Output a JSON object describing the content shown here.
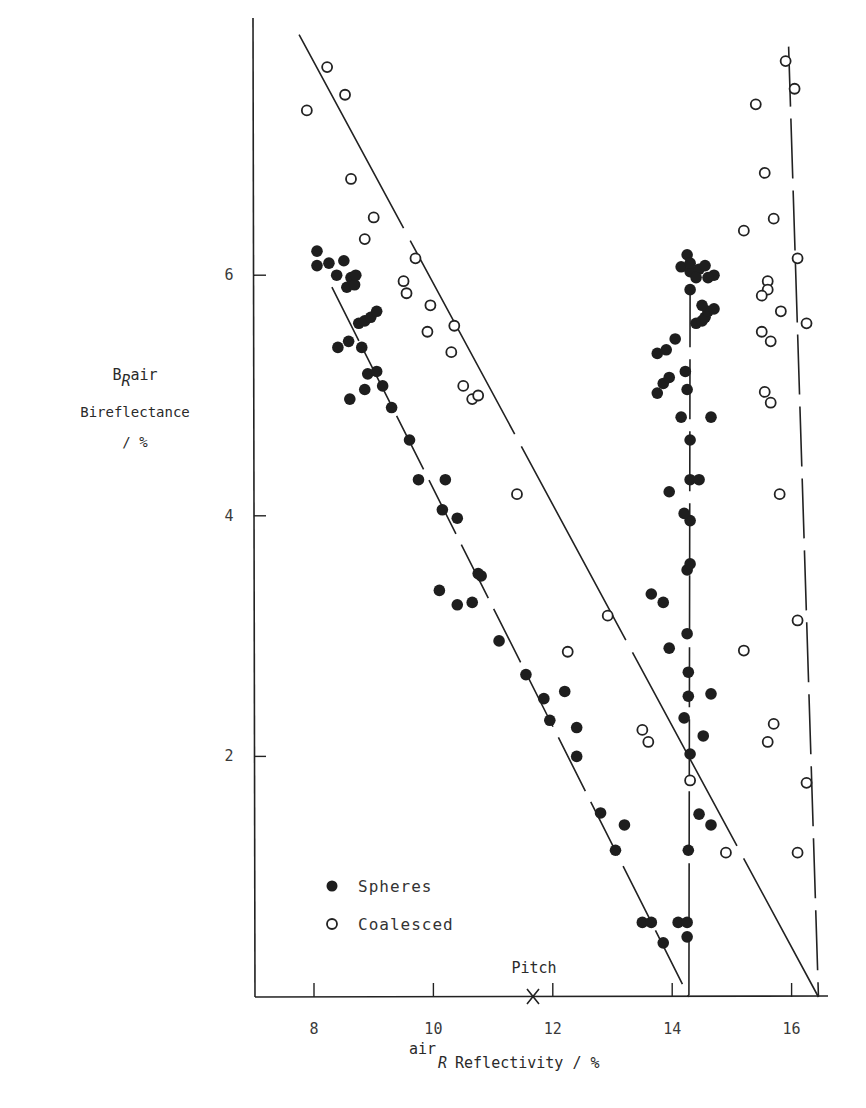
{
  "chart_data": {
    "type": "scatter",
    "title": "",
    "xlabel": "airR Reflectivity / %",
    "ylabel": "B R air Bireflectance / %",
    "xlim": [
      7.0,
      16.6
    ],
    "ylim": [
      0,
      8.2
    ],
    "x_ticks": [
      8,
      10,
      12,
      14,
      16
    ],
    "y_ticks": [
      2,
      4,
      6
    ],
    "grid": false,
    "legend_position": "lower-left",
    "annotations": [
      {
        "text": "Pitch",
        "x": 11.8,
        "y": 0,
        "marker": "X"
      }
    ],
    "series": [
      {
        "name": "Spheres",
        "marker": "filled-circle",
        "points": [
          [
            8.05,
            6.2
          ],
          [
            8.05,
            6.08
          ],
          [
            8.25,
            6.1
          ],
          [
            8.38,
            6.0
          ],
          [
            8.5,
            6.12
          ],
          [
            8.62,
            5.98
          ],
          [
            8.55,
            5.9
          ],
          [
            8.68,
            5.92
          ],
          [
            8.7,
            6.0
          ],
          [
            8.4,
            5.4
          ],
          [
            8.58,
            5.45
          ],
          [
            8.75,
            5.6
          ],
          [
            8.85,
            5.62
          ],
          [
            8.95,
            5.65
          ],
          [
            9.05,
            5.7
          ],
          [
            8.8,
            5.4
          ],
          [
            8.9,
            5.18
          ],
          [
            8.85,
            5.05
          ],
          [
            9.05,
            5.2
          ],
          [
            8.6,
            4.97
          ],
          [
            9.15,
            5.08
          ],
          [
            9.3,
            4.9
          ],
          [
            9.6,
            4.63
          ],
          [
            9.75,
            4.3
          ],
          [
            10.2,
            4.3
          ],
          [
            10.15,
            4.05
          ],
          [
            10.4,
            3.98
          ],
          [
            10.75,
            3.52
          ],
          [
            10.8,
            3.5
          ],
          [
            10.1,
            3.38
          ],
          [
            10.4,
            3.26
          ],
          [
            10.65,
            3.28
          ],
          [
            11.1,
            2.96
          ],
          [
            11.55,
            2.68
          ],
          [
            11.85,
            2.48
          ],
          [
            11.95,
            2.3
          ],
          [
            12.2,
            2.54
          ],
          [
            12.4,
            2.24
          ],
          [
            12.4,
            2.0
          ],
          [
            12.8,
            1.53
          ],
          [
            13.05,
            1.22
          ],
          [
            13.2,
            1.43
          ],
          [
            13.5,
            0.62
          ],
          [
            13.65,
            0.62
          ],
          [
            13.85,
            0.45
          ],
          [
            14.1,
            0.62
          ],
          [
            14.25,
            0.62
          ],
          [
            14.25,
            0.5
          ],
          [
            14.27,
            1.22
          ],
          [
            14.45,
            1.52
          ],
          [
            14.65,
            1.43
          ],
          [
            14.52,
            2.17
          ],
          [
            14.65,
            2.52
          ],
          [
            14.3,
            2.02
          ],
          [
            14.2,
            2.32
          ],
          [
            14.27,
            2.5
          ],
          [
            14.27,
            2.7
          ],
          [
            14.25,
            3.02
          ],
          [
            14.25,
            3.55
          ],
          [
            14.3,
            3.6
          ],
          [
            14.3,
            3.96
          ],
          [
            14.2,
            4.02
          ],
          [
            13.95,
            4.2
          ],
          [
            14.3,
            4.3
          ],
          [
            14.45,
            4.3
          ],
          [
            14.3,
            4.63
          ],
          [
            14.15,
            4.82
          ],
          [
            14.65,
            4.82
          ],
          [
            14.25,
            5.05
          ],
          [
            14.22,
            5.2
          ],
          [
            13.75,
            5.02
          ],
          [
            13.85,
            5.1
          ],
          [
            13.95,
            5.15
          ],
          [
            13.75,
            5.35
          ],
          [
            13.9,
            5.38
          ],
          [
            14.05,
            5.47
          ],
          [
            14.4,
            5.6
          ],
          [
            14.5,
            5.62
          ],
          [
            14.55,
            5.65
          ],
          [
            14.6,
            5.7
          ],
          [
            14.7,
            5.72
          ],
          [
            14.5,
            5.75
          ],
          [
            14.3,
            5.88
          ],
          [
            14.15,
            6.07
          ],
          [
            14.3,
            6.03
          ],
          [
            14.45,
            6.05
          ],
          [
            14.55,
            6.08
          ],
          [
            14.7,
            6.0
          ],
          [
            14.6,
            5.98
          ],
          [
            14.25,
            6.17
          ],
          [
            14.3,
            6.1
          ],
          [
            14.4,
            5.98
          ],
          [
            13.95,
            2.9
          ],
          [
            13.65,
            3.35
          ],
          [
            13.85,
            3.28
          ]
        ]
      },
      {
        "name": "Coalesced",
        "marker": "open-circle",
        "points": [
          [
            7.88,
            7.37
          ],
          [
            8.22,
            7.73
          ],
          [
            8.52,
            7.5
          ],
          [
            8.62,
            6.8
          ],
          [
            8.85,
            6.3
          ],
          [
            9.0,
            6.48
          ],
          [
            9.7,
            6.14
          ],
          [
            9.5,
            5.95
          ],
          [
            9.55,
            5.85
          ],
          [
            9.95,
            5.75
          ],
          [
            9.9,
            5.53
          ],
          [
            10.35,
            5.58
          ],
          [
            10.3,
            5.36
          ],
          [
            10.5,
            5.08
          ],
          [
            10.65,
            4.97
          ],
          [
            10.75,
            5.0
          ],
          [
            11.4,
            4.18
          ],
          [
            12.92,
            3.17
          ],
          [
            12.25,
            2.87
          ],
          [
            13.5,
            2.22
          ],
          [
            13.6,
            2.12
          ],
          [
            14.3,
            1.8
          ],
          [
            14.9,
            1.2
          ],
          [
            15.9,
            7.78
          ],
          [
            16.05,
            7.55
          ],
          [
            15.4,
            7.42
          ],
          [
            15.55,
            6.85
          ],
          [
            15.7,
            6.47
          ],
          [
            15.2,
            6.37
          ],
          [
            16.1,
            6.14
          ],
          [
            15.6,
            5.95
          ],
          [
            15.6,
            5.88
          ],
          [
            15.5,
            5.83
          ],
          [
            15.82,
            5.7
          ],
          [
            16.25,
            5.6
          ],
          [
            15.5,
            5.53
          ],
          [
            15.65,
            5.45
          ],
          [
            15.55,
            5.03
          ],
          [
            15.65,
            4.94
          ],
          [
            15.8,
            4.18
          ],
          [
            16.1,
            3.13
          ],
          [
            15.2,
            2.88
          ],
          [
            15.7,
            2.27
          ],
          [
            15.6,
            2.12
          ],
          [
            16.25,
            1.78
          ],
          [
            16.1,
            1.2
          ]
        ]
      }
    ],
    "fit_lines": [
      {
        "series": "Coalesced",
        "style": "long-dash",
        "from": [
          7.75,
          8.0
        ],
        "to": [
          16.45,
          0
        ]
      },
      {
        "series": "Spheres",
        "style": "dash",
        "from": [
          8.3,
          5.9
        ],
        "to": [
          14.28,
          0
        ]
      },
      {
        "series": "Spheres",
        "style": "dash",
        "from": [
          14.3,
          5.9
        ],
        "to": [
          14.28,
          0
        ]
      },
      {
        "series": "Coalesced",
        "style": "dash",
        "from": [
          15.95,
          7.9
        ],
        "to": [
          16.45,
          0
        ]
      }
    ]
  },
  "axes": {
    "x_tick_labels": [
      "8",
      "10",
      "12",
      "14",
      "16"
    ],
    "y_tick_labels": [
      "2",
      "4",
      "6"
    ],
    "x_label_prefix": "air",
    "x_label_sub": "R",
    "x_label_main": " Reflectivity / %",
    "y_label_symbol": "B",
    "y_label_sub": "R",
    "y_label_sup": "air",
    "y_label_name": "Bireflectance",
    "y_label_unit": "/ %"
  },
  "legend": {
    "spheres": "Spheres",
    "coalesced": "Coalesced"
  },
  "annotation": {
    "pitch": "Pitch"
  },
  "caption": ""
}
